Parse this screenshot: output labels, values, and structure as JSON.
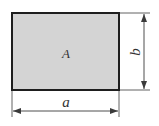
{
  "diagram": {
    "type": "rectangle-dimensions",
    "area_label": "A",
    "width_label": "a",
    "height_label": "b",
    "colors": {
      "fill": "#d4d4d4",
      "border": "#1e1e1e",
      "dimension_line": "#3a3a3a",
      "text": "#333333"
    }
  }
}
